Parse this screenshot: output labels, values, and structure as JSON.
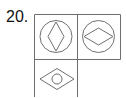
{
  "question": {
    "number_label": "20."
  },
  "puzzle": {
    "type": "figure-matrix",
    "rows": 2,
    "columns": 2,
    "line_color": "#6e6e6e",
    "shape_color": "#707070",
    "cells": [
      {
        "position": "row1-col1",
        "outer": "circle",
        "inner": "vertical-diamond"
      },
      {
        "position": "row1-col2",
        "outer": "circle",
        "inner": "horizontal-diamond"
      },
      {
        "position": "row2-col1",
        "outer": "horizontal-diamond",
        "inner": "small-circle"
      },
      {
        "position": "row2-col2",
        "outer": "empty",
        "inner": "empty"
      }
    ]
  }
}
